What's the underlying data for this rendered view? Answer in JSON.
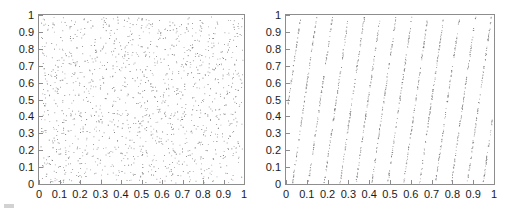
{
  "figure": {
    "width": 513,
    "height": 209,
    "background": "#ffffff",
    "frame_color": "#8d8d8d",
    "point_color": "#9a9a9a",
    "point_color_dark": "#5a5a5a",
    "text_color": "#1b1b1b"
  },
  "axis": {
    "tick_labels": [
      "0",
      "0.1",
      "0.2",
      "0.3",
      "0.4",
      "0.5",
      "0.6",
      "0.7",
      "0.8",
      "0.9",
      "1"
    ],
    "tick_values": [
      0,
      0.1,
      0.2,
      0.3,
      0.4,
      0.5,
      0.6,
      0.7,
      0.8,
      0.9,
      1
    ],
    "xlim": [
      0,
      1
    ],
    "ylim": [
      0,
      1
    ],
    "grid": false,
    "tick_direction": "in"
  },
  "chart_data": [
    {
      "type": "scatter",
      "panel": "left",
      "title": "",
      "xlabel": "",
      "ylabel": "",
      "xlim": [
        0,
        1
      ],
      "ylim": [
        0,
        1
      ],
      "grid": false,
      "legend": "none",
      "xticks": [
        0,
        0.1,
        0.2,
        0.3,
        0.4,
        0.5,
        0.6,
        0.7,
        0.8,
        0.9,
        1
      ],
      "yticks": [
        0,
        0.1,
        0.2,
        0.3,
        0.4,
        0.5,
        0.6,
        0.7,
        0.8,
        0.9,
        1
      ],
      "xticklabels": [
        "0",
        "0.1",
        "0.2",
        "0.3",
        "0.4",
        "0.5",
        "0.6",
        "0.7",
        "0.8",
        "0.9",
        "1"
      ],
      "yticklabels": [
        "0",
        "0.1",
        "0.2",
        "0.3",
        "0.4",
        "0.5",
        "0.6",
        "0.7",
        "0.8",
        "0.9",
        "1"
      ],
      "description": "uniformly scattered random points filling the unit square with no visible structure",
      "n_points": 1400,
      "marker": "dot",
      "marker_size": 1,
      "distribution": "uniform-random",
      "seed": 20250114
    },
    {
      "type": "scatter",
      "panel": "right",
      "title": "",
      "xlabel": "",
      "ylabel": "",
      "xlim": [
        0,
        1
      ],
      "ylim": [
        0,
        1
      ],
      "grid": false,
      "legend": "none",
      "xticks": [
        0,
        0.1,
        0.2,
        0.3,
        0.4,
        0.5,
        0.6,
        0.7,
        0.8,
        0.9,
        1
      ],
      "yticks": [
        0,
        0.1,
        0.2,
        0.3,
        0.4,
        0.5,
        0.6,
        0.7,
        0.8,
        0.9,
        1
      ],
      "xticklabels": [
        "0",
        "0.1",
        "0.2",
        "0.3",
        "0.4",
        "0.5",
        "0.6",
        "0.7",
        "0.8",
        "0.9",
        "1"
      ],
      "yticklabels": [
        "0",
        "0.1",
        "0.2",
        "0.3",
        "0.4",
        "0.5",
        "0.6",
        "0.7",
        "0.8",
        "0.9",
        "1"
      ],
      "description": "points collapse onto about 13 steep parallel lattice lines that lean to the right as they rise",
      "n_points": 1400,
      "marker": "dot",
      "marker_size": 1,
      "distribution": "lattice",
      "lattice_line_count": 13,
      "lattice_slope": 8.5,
      "lattice_x_intercepts": [
        -0.055,
        0.0225,
        0.1,
        0.1775,
        0.255,
        0.3325,
        0.41,
        0.4875,
        0.565,
        0.6425,
        0.72,
        0.7975,
        0.875,
        0.9525
      ],
      "seed": 771102
    }
  ]
}
